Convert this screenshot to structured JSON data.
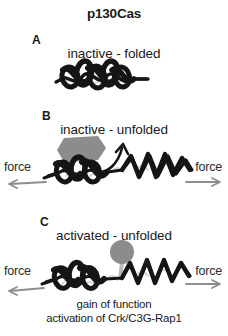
{
  "figure": {
    "title": "p130Cas",
    "background_color": "#ffffff",
    "ink_color": "#151515",
    "badge_gray": "#8c8c8c",
    "arrow_gray": "#8e8e8e"
  },
  "panels": [
    {
      "letter": "A",
      "caption": "inactive - folded",
      "state": "folded",
      "has_force": false,
      "badges": []
    },
    {
      "letter": "B",
      "caption": "inactive - unfolded",
      "state": "unfolded",
      "has_force": true,
      "force_left_label": "force",
      "force_right_label": "force",
      "badges": [
        {
          "label": "SFK",
          "shape": "hexagon",
          "color": "#8c8c8c"
        }
      ]
    },
    {
      "letter": "C",
      "caption": "activated - unfolded",
      "state": "unfolded-phosphorylated",
      "has_force": true,
      "force_left_label": "force",
      "force_right_label": "force",
      "badges": [
        {
          "label": "P",
          "shape": "circle",
          "color": "#8c8c8c"
        }
      ]
    }
  ],
  "annotation": {
    "line1": "gain of function",
    "line2": "activation of Crk/C3G-Rap1"
  },
  "icons": {
    "coil": "alpha-helix-coil-icon",
    "hexagon": "kinase-hexagon-icon",
    "phospho": "phosphate-circle-icon",
    "arrow_left": "force-arrow-left-icon",
    "arrow_right": "force-arrow-right-icon",
    "curved_arrow": "unfolding-curved-arrow-icon"
  }
}
